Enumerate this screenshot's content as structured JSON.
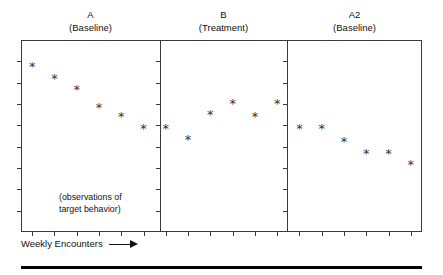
{
  "figure": {
    "annotation_lines": [
      "(observations of",
      "target behavior)"
    ],
    "xaxis_label": "Weekly Encounters",
    "arrow_icon": "right-arrow-icon",
    "frame_color": "#3a3a3a",
    "marker_color": "#333333",
    "rule_color": "#000000"
  },
  "chart_data": {
    "type": "scatter",
    "title": "",
    "subtitle": "",
    "xlabel": "Weekly Encounters",
    "ylabel": "",
    "grid": false,
    "legend": "none",
    "marker": "*",
    "annotations": [
      "(observations of target behavior)"
    ],
    "xlim": [
      0,
      18
    ],
    "ylim": [
      0,
      10
    ],
    "x_tick_count": 18,
    "y_tick_count": 8,
    "panels": [
      {
        "id": "A",
        "label": "A",
        "sublabel": "(Baseline)",
        "phase": "Baseline",
        "x": [
          1,
          2,
          3,
          4,
          5,
          6
        ],
        "values": [
          8.6,
          8.0,
          7.4,
          6.5,
          6.0,
          5.4
        ],
        "points": [
          {
            "x": 1,
            "y": 8.6
          },
          {
            "x": 2,
            "y": 8.0
          },
          {
            "x": 3,
            "y": 7.4
          },
          {
            "x": 4,
            "y": 6.5
          },
          {
            "x": 5,
            "y": 6.0
          },
          {
            "x": 6,
            "y": 5.4
          }
        ]
      },
      {
        "id": "B",
        "label": "B",
        "sublabel": "(Treatment)",
        "phase": "Treatment",
        "x": [
          7,
          8,
          9,
          10,
          11,
          12
        ],
        "values": [
          5.4,
          4.8,
          6.1,
          6.7,
          6.0,
          6.7
        ],
        "points": [
          {
            "x": 7,
            "y": 5.4
          },
          {
            "x": 8,
            "y": 4.8
          },
          {
            "x": 9,
            "y": 6.1
          },
          {
            "x": 10,
            "y": 6.7
          },
          {
            "x": 11,
            "y": 6.0
          },
          {
            "x": 12,
            "y": 6.7
          }
        ]
      },
      {
        "id": "A2",
        "label": "A2",
        "sublabel": "(Baseline)",
        "phase": "Baseline",
        "x": [
          13,
          14,
          15,
          16,
          17,
          18
        ],
        "values": [
          5.4,
          5.4,
          4.7,
          4.1,
          4.1,
          3.5
        ],
        "points": [
          {
            "x": 13,
            "y": 5.4
          },
          {
            "x": 14,
            "y": 5.4
          },
          {
            "x": 15,
            "y": 4.7
          },
          {
            "x": 16,
            "y": 4.1
          },
          {
            "x": 17,
            "y": 4.1
          },
          {
            "x": 18,
            "y": 3.5
          }
        ]
      }
    ]
  }
}
